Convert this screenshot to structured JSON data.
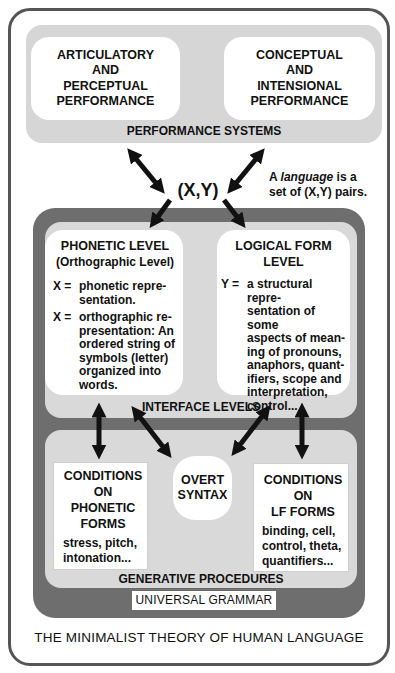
{
  "performance_systems": {
    "label": "PERFORMANCE SYSTEMS",
    "articulatory": "ARTICULATORY\nAND\nPERCEPTUAL\nPERFORMANCE",
    "conceptual": "CONCEPTUAL\nAND\nINTENSIONAL\nPERFORMANCE"
  },
  "pair": {
    "label": "(X,Y)",
    "note_prefix": "A ",
    "note_italic": "language",
    "note_suffix": " is a",
    "note_line2": "set of (X,Y) pairs."
  },
  "interface_levels": {
    "label": "INTERFACE LEVELS",
    "phonetic": {
      "title": "PHONETIC LEVEL",
      "subtitle": "(Orthographic Level)",
      "defs": [
        {
          "lhs": "X =",
          "rhs": "phonetic repre-\nsentation."
        },
        {
          "lhs": "X =",
          "rhs": "orthographic re-\npresentation: An\nordered string of\nsymbols (letter)\norganized into\nwords."
        }
      ]
    },
    "logical_form": {
      "title": "LOGICAL FORM",
      "subtitle": "LEVEL",
      "defs": [
        {
          "lhs": "Y =",
          "rhs": "a structural repre-\nsentation of some\naspects of  mean-\ning of pronouns,\nanaphors, quant-\nifiers, scope and\ninterpretation,\ncontrol..."
        }
      ]
    }
  },
  "generative_procedures": {
    "label": "GENERATIVE PROCEDURES",
    "phonetic_conditions": {
      "title": "CONDITIONS\nON\nPHONETIC\nFORMS",
      "body": "stress, pitch,\nintonation..."
    },
    "overt_syntax": "OVERT\nSYNTAX",
    "lf_conditions": {
      "title": "CONDITIONS\nON\nLF FORMS",
      "body": "binding, cell,\ncontrol, theta,\nquantifiers..."
    }
  },
  "universal_grammar": "UNIVERSAL GRAMMAR",
  "caption": "THE MINIMALIST THEORY OF HUMAN LANGUAGE",
  "colors": {
    "outer_border": "#555555",
    "light_gray": "#d9d9d9",
    "dark_gray": "#6e6e6e",
    "arrow": "#111111"
  }
}
